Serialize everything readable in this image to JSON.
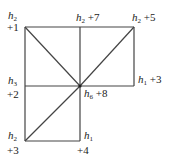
{
  "diagram": {
    "line_color": "#444444",
    "nodes": [
      {
        "id": "tl",
        "var": "h",
        "sub": "2",
        "offset": "+1"
      },
      {
        "id": "tm",
        "var": "h",
        "sub": "2",
        "offset": "+7"
      },
      {
        "id": "tr",
        "var": "h",
        "sub": "2",
        "offset": "+5"
      },
      {
        "id": "mr",
        "var": "h",
        "sub": "1",
        "offset": "+3"
      },
      {
        "id": "ml",
        "var": "h",
        "sub": "3",
        "offset": "+2"
      },
      {
        "id": "center",
        "var": "h",
        "sub": "6",
        "offset": "+8"
      },
      {
        "id": "bl",
        "var": "h",
        "sub": "2",
        "offset": "+3"
      },
      {
        "id": "br",
        "var": "h",
        "sub": "1",
        "offset": "+4"
      }
    ]
  }
}
